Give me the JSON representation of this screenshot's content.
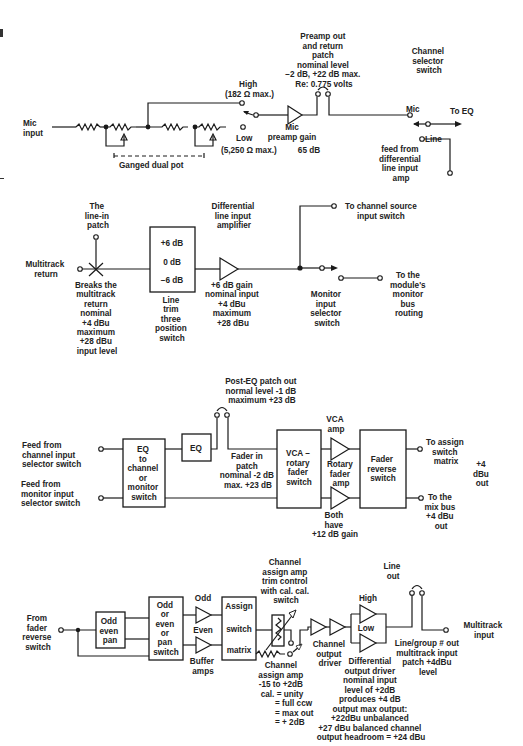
{
  "section1": {
    "mic_input": [
      "Mic",
      "input"
    ],
    "high": "High",
    "high_imp": "(182 Ω max.)",
    "low": "Low",
    "low_imp": "(5,250 Ω max.)",
    "ganged": "Ganged dual pot",
    "preamp_label": [
      "Mic",
      "preamp gain"
    ],
    "preamp_gain": "65 dB",
    "patch_note": [
      "Preamp out",
      "and return",
      "patch",
      "nominal level",
      "−2 dB, +22 dB max.",
      "Re: 0.775 volts"
    ],
    "channel_selector": [
      "Channel",
      "selector",
      "switch"
    ],
    "mic": "Mic",
    "to_eq": "To EQ",
    "line_feed": [
      "Line",
      "feed from",
      "differential",
      "line input",
      "amp"
    ]
  },
  "section2": {
    "multitrack_return": [
      "Multitrack",
      "return"
    ],
    "line_in_patch": [
      "The",
      "line-in",
      "patch"
    ],
    "breaks_note": [
      "Breaks the",
      "multitrack",
      "return",
      "nominal",
      "+4 dBu",
      "maximum",
      "+28 dBu",
      "input level"
    ],
    "trim_values": [
      "+6 dB",
      "0 dB",
      "−6 dB"
    ],
    "trim_label": [
      "Line",
      "trim",
      "three",
      "position",
      "switch"
    ],
    "diff_amp": [
      "Differential",
      "line input",
      "amplifier"
    ],
    "diff_amp_note": [
      "+6 dB gain",
      "nominal input",
      "+4 dBu",
      "maximum",
      "+28 dBu"
    ],
    "to_channel_source": [
      "To  channel source",
      "input switch"
    ],
    "monitor_selector": [
      "Monitor",
      "input",
      "selector",
      "switch"
    ],
    "to_monitor_bus": [
      "To the",
      "module's",
      "monitor",
      "bus",
      "routing"
    ]
  },
  "section3": {
    "feed_channel": [
      "Feed from",
      "channel input",
      "selector switch"
    ],
    "feed_monitor": [
      "Feed from",
      "monitor input",
      "selector switch"
    ],
    "eq_switch_box": [
      "EQ",
      "to",
      "channel",
      "or",
      "monitor",
      "switch"
    ],
    "eq_box": "EQ",
    "post_eq_note": [
      "Post-EQ patch out",
      "normal level -1 dB",
      "maximum +23 dB"
    ],
    "fader_in_patch": [
      "Fader in",
      "patch",
      "nominal -2 dB",
      "max. +23 dB"
    ],
    "vca_box": [
      "VCA  –",
      "rotary",
      "fader",
      "switch"
    ],
    "vca_amp": [
      "VCA",
      "amp"
    ],
    "rotary_amp": [
      "Rotary",
      "fader",
      "amp"
    ],
    "both_have": [
      "Both",
      "have",
      "+12 dB gain"
    ],
    "fader_reverse_box": [
      "Fader",
      "reverse",
      "switch"
    ],
    "to_assign": [
      "To assign",
      "switch",
      "matrix"
    ],
    "to_mix_bus": [
      "To the",
      "mix bus",
      "+4 dBu",
      "out"
    ],
    "plus4_out": [
      "+4",
      "dBu",
      "out"
    ]
  },
  "section4": {
    "from_fader": [
      "From",
      "fader",
      "reverse",
      "switch"
    ],
    "odd_even_pan_box": [
      "Odd",
      "even",
      "pan"
    ],
    "odd_even_switch_box": [
      "Odd",
      "or",
      "even",
      "or",
      "pan",
      "switch"
    ],
    "odd": "Odd",
    "even": "Even",
    "buffer_amps": [
      "Buffer",
      "amps"
    ],
    "assign_box": [
      "Assign",
      "switch",
      "matrix"
    ],
    "trim_control": [
      "Channel",
      "assign amp",
      "trim control",
      "with cal.  cal.",
      "switch"
    ],
    "assign_amp_note": [
      "Channel",
      "assign amp",
      "-15 to +2dB",
      "cal. = unity"
    ],
    "assign_amp_note2": [
      "= full ccw",
      "= max out",
      "= + 2dB"
    ],
    "channel_output_driver": [
      "Channel",
      "output",
      "driver"
    ],
    "high": "High",
    "low": "Low",
    "diff_driver_note": [
      "Differential",
      "output driver",
      "nominal input",
      "level of +2dB",
      "produces +4 dB",
      "output max output:",
      "+22dBu unbalanced",
      "+27 dBu balanced channel",
      "output headroom = +24 dBu"
    ],
    "line_out": [
      "Line",
      "out"
    ],
    "line_group_note": [
      "Line/group # out",
      "multitrack input",
      "patch +4dBu",
      "level"
    ],
    "multitrack_input": [
      "Multitrack",
      "input"
    ]
  }
}
